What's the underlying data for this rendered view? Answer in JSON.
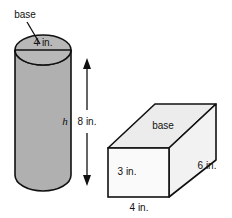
{
  "figure": {
    "background_color": "#ffffff",
    "stroke_color": "#111111",
    "cylinder": {
      "name": "cylinder",
      "fill_color": "#b0b0b0",
      "top_ellipse_fill": "#b8b8b8",
      "base_label": "base",
      "diameter_label": "4 in.",
      "height_variable_label": "h"
    },
    "height_dimension": {
      "name": "height-dimension",
      "label": "8 in.",
      "arrow_style": "double-headed-vertical"
    },
    "prism": {
      "name": "rectangular-prism",
      "top_face_fill": "#ececec",
      "front_face_fill": "#fafafa",
      "side_face_fill": "#f2f2f2",
      "base_label": "base",
      "height_label": "3 in.",
      "width_label": "4 in.",
      "depth_label": "6 in."
    }
  }
}
